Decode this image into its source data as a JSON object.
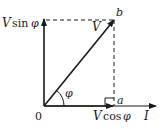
{
  "diagram": {
    "type": "phasor-diagram",
    "origin_label": "0",
    "phasor_label": "V",
    "point_b_label": "b",
    "point_a_label": "a",
    "current_label": "I",
    "angle_label": "φ",
    "vertical_component": {
      "prefix": "V",
      "fn": "sin",
      "arg": "φ"
    },
    "horizontal_component": {
      "prefix": "V",
      "fn": "cos",
      "arg": "φ"
    }
  },
  "colors": {
    "stroke": "#1a1a1a",
    "background": "#ffffff"
  }
}
